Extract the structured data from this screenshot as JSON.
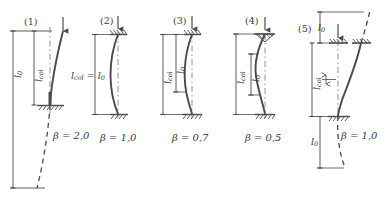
{
  "figure": {
    "domain_type": "engineering-diagram",
    "stroke_color": "#4a4a4a",
    "text_color": "#3a3a3a",
    "background_color": "#ffffff",
    "decimal_separator": "comma"
  },
  "symbols": {
    "beta": "β",
    "l": "l",
    "sub_0": "0",
    "sub_col": "col",
    "equals": "=",
    "l0_label": "l",
    "lcol_label": "l"
  },
  "cases": [
    {
      "id": "case-1",
      "number": "(1)",
      "beta_label": "β = 2,0",
      "beta_value": "2,0",
      "top_support": "free",
      "bottom_support": "fixed",
      "load_arrow": "down-arrow",
      "dims": [
        {
          "name": "l0",
          "base": "l",
          "sub": "0"
        },
        {
          "name": "lcol",
          "base": "l",
          "sub": "col"
        }
      ],
      "dim_relation": ""
    },
    {
      "id": "case-2",
      "number": "(2)",
      "beta_label": "β = 1,0",
      "beta_value": "1,0",
      "top_support": "pinned-hatched",
      "bottom_support": "pinned-hatched",
      "load_arrow": "down-arrow",
      "dims": [
        {
          "name": "lcol-equals-l0",
          "base": "l",
          "sub": "col"
        }
      ],
      "dim_relation": "l_col = l_0"
    },
    {
      "id": "case-3",
      "number": "(3)",
      "beta_label": "β = 0,7",
      "beta_value": "0,7",
      "top_support": "pinned-hatched",
      "bottom_support": "fixed",
      "load_arrow": "down-arrow",
      "dims": [
        {
          "name": "lcol",
          "base": "l",
          "sub": "col"
        },
        {
          "name": "l0",
          "base": "l",
          "sub": "0"
        }
      ],
      "dim_relation": ""
    },
    {
      "id": "case-4",
      "number": "(4)",
      "beta_label": "β = 0,5",
      "beta_value": "0,5",
      "top_support": "roller-triangle-hatched",
      "bottom_support": "fixed",
      "load_arrow": "down-arrow",
      "dims": [
        {
          "name": "lcol",
          "base": "l",
          "sub": "col"
        },
        {
          "name": "l0",
          "base": "l",
          "sub": "0"
        }
      ],
      "dim_relation": ""
    },
    {
      "id": "case-5",
      "number": "(5)",
      "beta_label": "β = 1,0",
      "beta_value": "1,0",
      "top_support": "pinned-hatched-sway",
      "bottom_support": "fixed",
      "load_arrow": "down-arrow",
      "dims": [
        {
          "name": "l0-top",
          "base": "l",
          "sub": "0"
        },
        {
          "name": "lcol",
          "base": "l",
          "sub": "col"
        },
        {
          "name": "l0-bottom",
          "base": "l",
          "sub": "0"
        }
      ],
      "dim_relation": ""
    }
  ]
}
